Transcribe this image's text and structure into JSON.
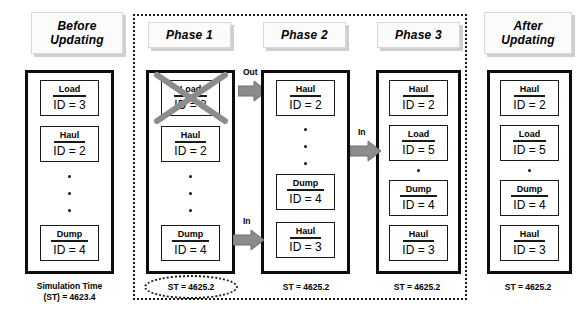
{
  "diagram": {
    "title_note": "Event queue update across three phases",
    "columns": [
      {
        "id": "before",
        "header": "Before\nUpdating",
        "header_line1": "Before",
        "header_line2": "Updating",
        "entities": [
          {
            "activity": "Load",
            "id_text": "ID = 3"
          },
          {
            "activity": "Haul",
            "id_text": "ID = 2"
          },
          {
            "activity": "Dump",
            "id_text": "ID = 4"
          }
        ],
        "dots": 3,
        "footer_line1": "Simulation Time",
        "footer_line2": "(ST) = 4623.4"
      },
      {
        "id": "phase1",
        "header_line1": "Phase 1",
        "header_line2": "",
        "entities": [
          {
            "activity": "Load",
            "id_text": "ID = 3",
            "struck": true
          },
          {
            "activity": "Haul",
            "id_text": "ID = 2"
          },
          {
            "activity": "Dump",
            "id_text": "ID = 4"
          }
        ],
        "dots": 3,
        "footer_line1": "ST = 4625.2",
        "footer_highlighted": true
      },
      {
        "id": "phase2",
        "header_line1": "Phase 2",
        "header_line2": "",
        "entities": [
          {
            "activity": "Haul",
            "id_text": "ID = 2"
          },
          {
            "activity": "Dump",
            "id_text": "ID = 4"
          },
          {
            "activity": "Haul",
            "id_text": "ID = 3"
          }
        ],
        "dots": 3,
        "footer_line1": "ST = 4625.2"
      },
      {
        "id": "phase3",
        "header_line1": "Phase 3",
        "header_line2": "",
        "entities": [
          {
            "activity": "Haul",
            "id_text": "ID = 2"
          },
          {
            "activity": "Load",
            "id_text": "ID = 5"
          },
          {
            "activity": "Dump",
            "id_text": "ID = 4"
          },
          {
            "activity": "Haul",
            "id_text": "ID = 3"
          }
        ],
        "dots": 1,
        "footer_line1": "ST = 4625.2"
      },
      {
        "id": "after",
        "header_line1": "After",
        "header_line2": "Updating",
        "entities": [
          {
            "activity": "Haul",
            "id_text": "ID = 2"
          },
          {
            "activity": "Load",
            "id_text": "ID = 5"
          },
          {
            "activity": "Dump",
            "id_text": "ID = 4"
          },
          {
            "activity": "Haul",
            "id_text": "ID = 3"
          }
        ],
        "dots": 1,
        "footer_line1": "ST = 4625.2"
      }
    ],
    "arrows": [
      {
        "id": "out-arrow",
        "label": "Out"
      },
      {
        "id": "in-arrow-1",
        "label": "In"
      },
      {
        "id": "in-arrow-2",
        "label": "In"
      }
    ],
    "colors": {
      "line": "#0d0d0d",
      "arrow_fill": "#8c8c8c",
      "strike": "#8c8c8c",
      "header_bg": "#fbfbfb",
      "header_shadow": "#cfcfcf"
    }
  }
}
